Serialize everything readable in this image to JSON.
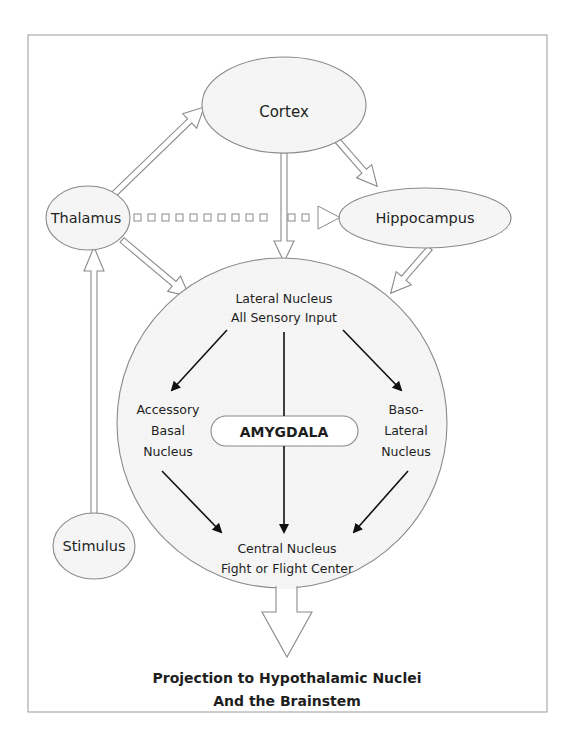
{
  "diagram": {
    "nodes": {
      "cortex": "Cortex",
      "thalamus": "Thalamus",
      "hippocampus": "Hippocampus",
      "stimulus": "Stimulus",
      "lateral_1": "Lateral Nucleus",
      "lateral_2": "All Sensory Input",
      "accessory_1": "Accessory",
      "accessory_2": "Basal",
      "accessory_3": "Nucleus",
      "baso_1": "Baso-",
      "baso_2": "Lateral",
      "baso_3": "Nucleus",
      "amygdala": "AMYGDALA",
      "central_1": "Central Nucleus",
      "central_2": "Fight or Flight Center"
    },
    "output": {
      "line1": "Projection to Hypothalamic Nuclei",
      "line2": "And the Brainstem"
    },
    "colors": {
      "stroke": "#8a8a8a",
      "fill": "#f4f4f4",
      "arrow": "#111111",
      "text": "#1e1e1e"
    }
  }
}
